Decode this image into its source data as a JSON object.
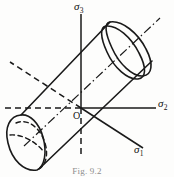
{
  "figure": {
    "caption": "Fig. 9.2",
    "origin_label": "O",
    "axes": [
      {
        "id": "sigma1",
        "symbol": "σ",
        "subscript": "1",
        "label": "σ1",
        "direction": "lower-right",
        "positive_style": "solid",
        "negative_style": "dashed"
      },
      {
        "id": "sigma2",
        "symbol": "σ",
        "subscript": "2",
        "label": "σ2",
        "direction": "right-horizontal",
        "positive_style": "solid",
        "negative_style": "dashed"
      },
      {
        "id": "sigma3",
        "symbol": "σ",
        "subscript": "3",
        "label": "σ3",
        "direction": "up-vertical",
        "positive_style": "solid",
        "negative_style": "dashed"
      }
    ],
    "surface": {
      "type": "cylinder",
      "axis_style": "dash-dot",
      "axis_name": "hydrostatic-axis",
      "near_cap_style": "solid-ellipse",
      "far_cap_style": "solid-with-hidden-dashed-arc"
    },
    "colors": {
      "ink": "#1a1a1a",
      "background": "#fdfdfc",
      "caption": "#8d8d8d"
    }
  }
}
